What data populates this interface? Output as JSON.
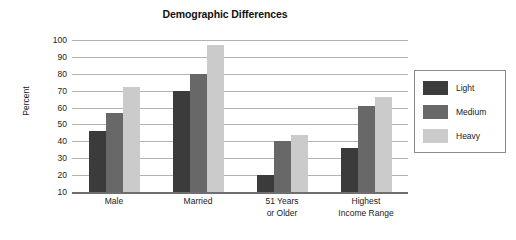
{
  "chart_data": {
    "type": "bar",
    "title": "Demographic Differences",
    "xlabel": "",
    "ylabel": "Percent",
    "ylim": [
      10,
      100
    ],
    "yticks": [
      10,
      20,
      30,
      40,
      50,
      60,
      70,
      80,
      90,
      100
    ],
    "grid": true,
    "legend_position": "right",
    "categories": [
      "Male",
      "Married",
      "51 Years or Older",
      "Highest Income Range"
    ],
    "category_lines": [
      [
        "Male"
      ],
      [
        "Married"
      ],
      [
        "51 Years",
        "or Older"
      ],
      [
        "Highest",
        "Income Range"
      ]
    ],
    "series": [
      {
        "name": "Light",
        "color": "#3b3b3b",
        "values": [
          46,
          70,
          20,
          36
        ]
      },
      {
        "name": "Medium",
        "color": "#686868",
        "values": [
          57,
          80,
          40,
          61
        ]
      },
      {
        "name": "Heavy",
        "color": "#cbcbcb",
        "values": [
          72,
          97,
          44,
          66
        ]
      }
    ]
  },
  "colors": {
    "background": "#ffffff",
    "gridline": "#b3b3b3",
    "axis": "#6f6f6f",
    "text": "#222222",
    "legend_border": "#8c8c8c"
  }
}
